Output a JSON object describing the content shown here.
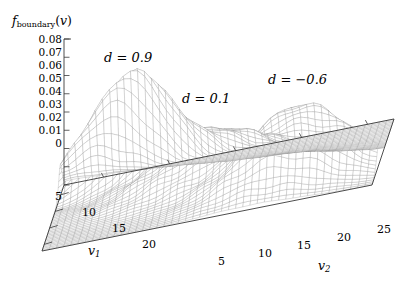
{
  "figure": {
    "background": "#ffffff",
    "mesh_color": "#8c8c8c",
    "axis_color": "#3a3a3a",
    "text_color": "#1a1a1a"
  },
  "zaxis": {
    "title_main": "f",
    "title_sub": "boundary",
    "title_arg_open": "(",
    "title_arg": "v",
    "title_arg_close": ")",
    "ticks": [
      "0.08",
      "0.07",
      "0.06",
      "0.05",
      "0.04",
      "0.03",
      "0.02",
      "0.01",
      "0"
    ]
  },
  "xaxis": {
    "name": "v",
    "name_sub": "1",
    "ticks": [
      "5",
      "10",
      "15",
      "20"
    ]
  },
  "yaxis": {
    "name": "v",
    "name_sub": "2",
    "ticks": [
      "5",
      "10",
      "15",
      "20",
      "25"
    ]
  },
  "annotations": [
    {
      "id": "peak-d09",
      "text": "d = 0.9"
    },
    {
      "id": "peak-d01",
      "text": "d = 0.1"
    },
    {
      "id": "peak-dm06",
      "text": "d = −0.6"
    }
  ],
  "chart_data": {
    "type": "surface",
    "title": "",
    "xlabel": "v1",
    "ylabel": "v2",
    "zlabel": "f_boundary(v)",
    "xlim": [
      2,
      22
    ],
    "ylim": [
      2,
      27
    ],
    "zlim": [
      0,
      0.08
    ],
    "zticks": [
      0,
      0.01,
      0.02,
      0.03,
      0.04,
      0.05,
      0.06,
      0.07,
      0.08
    ],
    "xticks": [
      5,
      10,
      15,
      20
    ],
    "yticks": [
      5,
      10,
      15,
      20,
      25
    ],
    "grid": false,
    "legend": false,
    "mesh_nx": 46,
    "mesh_ny": 46,
    "peaks": [
      {
        "label": "d = 0.9",
        "d": 0.9,
        "amplitude": 0.062,
        "cx": 7.0,
        "cy": 7.5,
        "sx": 1.9,
        "sy": 3.4,
        "rho": 0.55
      },
      {
        "label": "d = 0.1",
        "d": 0.1,
        "amplitude": 0.03,
        "cx": 12.5,
        "cy": 14.5,
        "sx": 2.6,
        "sy": 4.6,
        "rho": 0.1
      },
      {
        "label": "d = -0.6",
        "d": -0.6,
        "amplitude": 0.04,
        "cx": 17.0,
        "cy": 21.0,
        "sx": 2.1,
        "sy": 3.8,
        "rho": -0.35
      }
    ],
    "ripple": {
      "amplitude": 0.0016,
      "wavelength_x": 3.1,
      "wavelength_y": 3.6
    }
  }
}
